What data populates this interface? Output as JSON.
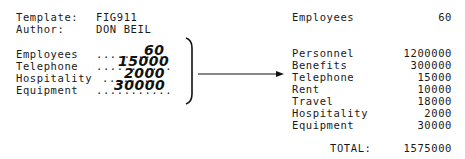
{
  "template_form": {
    "header": {
      "template_label": "Template:",
      "template_value": "FIG911",
      "author_label": "Author:",
      "author_value": "DON BEIL"
    },
    "fields": [
      {
        "label": "Employees",
        "dots": "..........",
        "value": "60"
      },
      {
        "label": "Telephone",
        "dots": "...........",
        "value": "15000"
      },
      {
        "label": "Hospitality",
        "dots": ".........",
        "value": "2000"
      },
      {
        "label": "Equipment",
        "dots": "...........",
        "value": "30000"
      }
    ]
  },
  "output_report": {
    "employees": {
      "label": "Employees",
      "value": "60"
    },
    "items": [
      {
        "label": "Personnel",
        "value": "1200000"
      },
      {
        "label": "Benefits",
        "value": "300000"
      },
      {
        "label": "Telephone",
        "value": "15000"
      },
      {
        "label": "Rent",
        "value": "10000"
      },
      {
        "label": "Travel",
        "value": "18000"
      },
      {
        "label": "Hospitality",
        "value": "2000"
      },
      {
        "label": "Equipment",
        "value": "30000"
      }
    ],
    "total": {
      "label": "TOTAL:",
      "value": "1575000"
    }
  }
}
